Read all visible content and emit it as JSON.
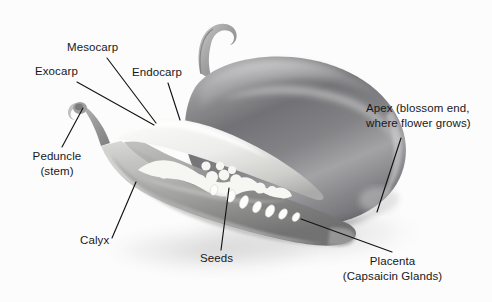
{
  "figure": {
    "background_color": "#fcfcfc",
    "label_color": "#18181a",
    "leader_line_color": "#141414"
  },
  "labels": [
    {
      "id": "mesocarp",
      "text": "Mesocarp",
      "sub": ""
    },
    {
      "id": "exocarp",
      "text": "Exocarp",
      "sub": ""
    },
    {
      "id": "endocarp",
      "text": "Endocarp",
      "sub": ""
    },
    {
      "id": "peduncle",
      "text": "Peduncle",
      "sub": "(stem)"
    },
    {
      "id": "calyx",
      "text": "Calyx",
      "sub": ""
    },
    {
      "id": "seeds",
      "text": "Seeds",
      "sub": ""
    },
    {
      "id": "apex",
      "text": "Apex (blossom end,",
      "sub": "where flower grows)"
    },
    {
      "id": "placenta",
      "text": "Placenta",
      "sub": "(Capsaicin Glands)"
    }
  ],
  "photo": {
    "whole_pepper": {
      "name": "whole-jalapeno",
      "tone": "#8d8d8f"
    },
    "cut_pepper": {
      "name": "halved-jalapeno",
      "tone": "#cfcfcf"
    },
    "interior": {
      "name": "placenta-and-seeds",
      "tone": "#f3f3f1"
    }
  }
}
